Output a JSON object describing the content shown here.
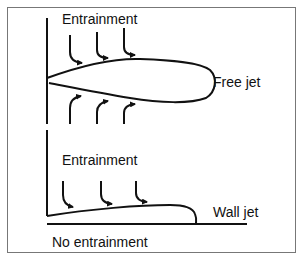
{
  "diagram": {
    "labels": {
      "entrainment_top": "Entrainment",
      "free_jet": "Free jet",
      "entrainment_bottom": "Entrainment",
      "wall_jet": "Wall jet",
      "no_entrainment": "No entrainment"
    },
    "colors": {
      "line": "#111111",
      "frame": "#777777",
      "background": "#ffffff"
    }
  }
}
